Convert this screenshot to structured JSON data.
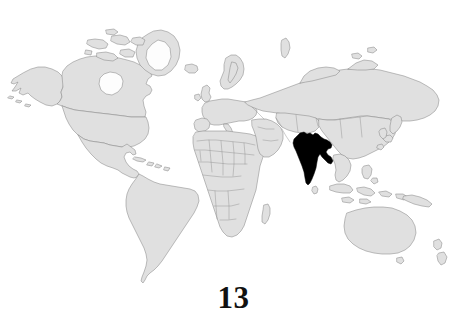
{
  "figure": {
    "caption": "13",
    "type": "world-map",
    "projection": "equirectangular",
    "background_color": "#ffffff"
  },
  "map": {
    "title": "",
    "land_fill_color": "#e0e0e0",
    "land_border_color": "#8a8a8a",
    "ice_fill_color": "#fdfdfd",
    "highlight_fill_color": "#000000",
    "highlighted_regions": [
      {
        "name": "India",
        "fill": "#000000"
      }
    ],
    "visible_landmasses": [
      "North America",
      "South America",
      "Greenland",
      "Iceland",
      "Europe",
      "Africa",
      "Madagascar",
      "Asia",
      "Russia",
      "China",
      "India",
      "Japan",
      "Indonesia",
      "Philippines",
      "Australia",
      "New Zealand"
    ],
    "internal_borders": true,
    "graticule": false,
    "ocean_fill_color": "#ffffff"
  }
}
